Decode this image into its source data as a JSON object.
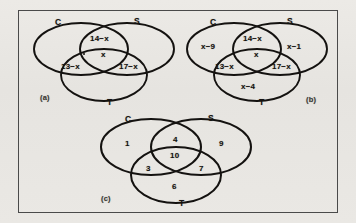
{
  "figure": {
    "background_color": "#e9e8e4",
    "ink_color": "#141210",
    "frame_color": "#4a4a4a",
    "panels": [
      {
        "tag": "(a)",
        "sets": {
          "left": "C",
          "right": "S",
          "bottom": "T"
        },
        "regions": [
          {
            "name": "c-and-s-only",
            "value": "14−x"
          },
          {
            "name": "center-all-three",
            "value": "x"
          },
          {
            "name": "c-and-t-only",
            "value": "13−x"
          },
          {
            "name": "s-and-t-only",
            "value": "17−x"
          },
          {
            "name": "c-only-dot-mark",
            "value": "•"
          }
        ]
      },
      {
        "tag": "(b)",
        "sets": {
          "left": "C",
          "right": "S",
          "bottom": "T"
        },
        "regions": [
          {
            "name": "c-only",
            "value": "x−9"
          },
          {
            "name": "c-and-s-only",
            "value": "14−x"
          },
          {
            "name": "s-only",
            "value": "x−1"
          },
          {
            "name": "center-all-three",
            "value": "x"
          },
          {
            "name": "c-and-t-only",
            "value": "13−x"
          },
          {
            "name": "s-and-t-only",
            "value": "17−x"
          },
          {
            "name": "t-only",
            "value": "x−4"
          }
        ]
      },
      {
        "tag": "(c)",
        "sets": {
          "left": "C",
          "right": "S",
          "bottom": "T"
        },
        "regions": [
          {
            "name": "c-only",
            "value": "1"
          },
          {
            "name": "c-and-s-only",
            "value": "4"
          },
          {
            "name": "s-only",
            "value": "9"
          },
          {
            "name": "center-all-three",
            "value": "10"
          },
          {
            "name": "c-and-t-only",
            "value": "3"
          },
          {
            "name": "s-and-t-only",
            "value": "7"
          },
          {
            "name": "t-only",
            "value": "6"
          }
        ]
      }
    ]
  }
}
